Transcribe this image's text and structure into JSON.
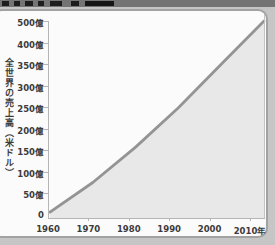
{
  "page": {
    "background_color": "#c6c6c6",
    "card_color": "#fbfbfb",
    "header_strip_color": "#747474"
  },
  "chart_data": {
    "type": "area",
    "title": "",
    "xlabel": "",
    "ylabel": "全世界の売上高（米ドル）",
    "x": [
      1960,
      1970,
      1980,
      1990,
      2000,
      2010
    ],
    "x_tick_labels": [
      "1960",
      "1970",
      "1980",
      "1990",
      "2000",
      "2010年"
    ],
    "y_tick_labels": [
      "500億",
      "400億",
      "350億",
      "300億",
      "250億",
      "200億",
      "150億",
      "100億",
      "50億",
      "0"
    ],
    "series": [
      {
        "name": "全世界の売上高",
        "values": [
          15,
          90,
          180,
          280,
          390,
          500
        ]
      }
    ],
    "ylim": [
      0,
      500
    ],
    "xlim": [
      1960,
      2010
    ],
    "grid": false,
    "legend": false,
    "area_fill_color": "#e8e8e8",
    "line_color": "#949494",
    "axis_color": "#b5b5b5",
    "text_color": "#3b3b3b"
  }
}
